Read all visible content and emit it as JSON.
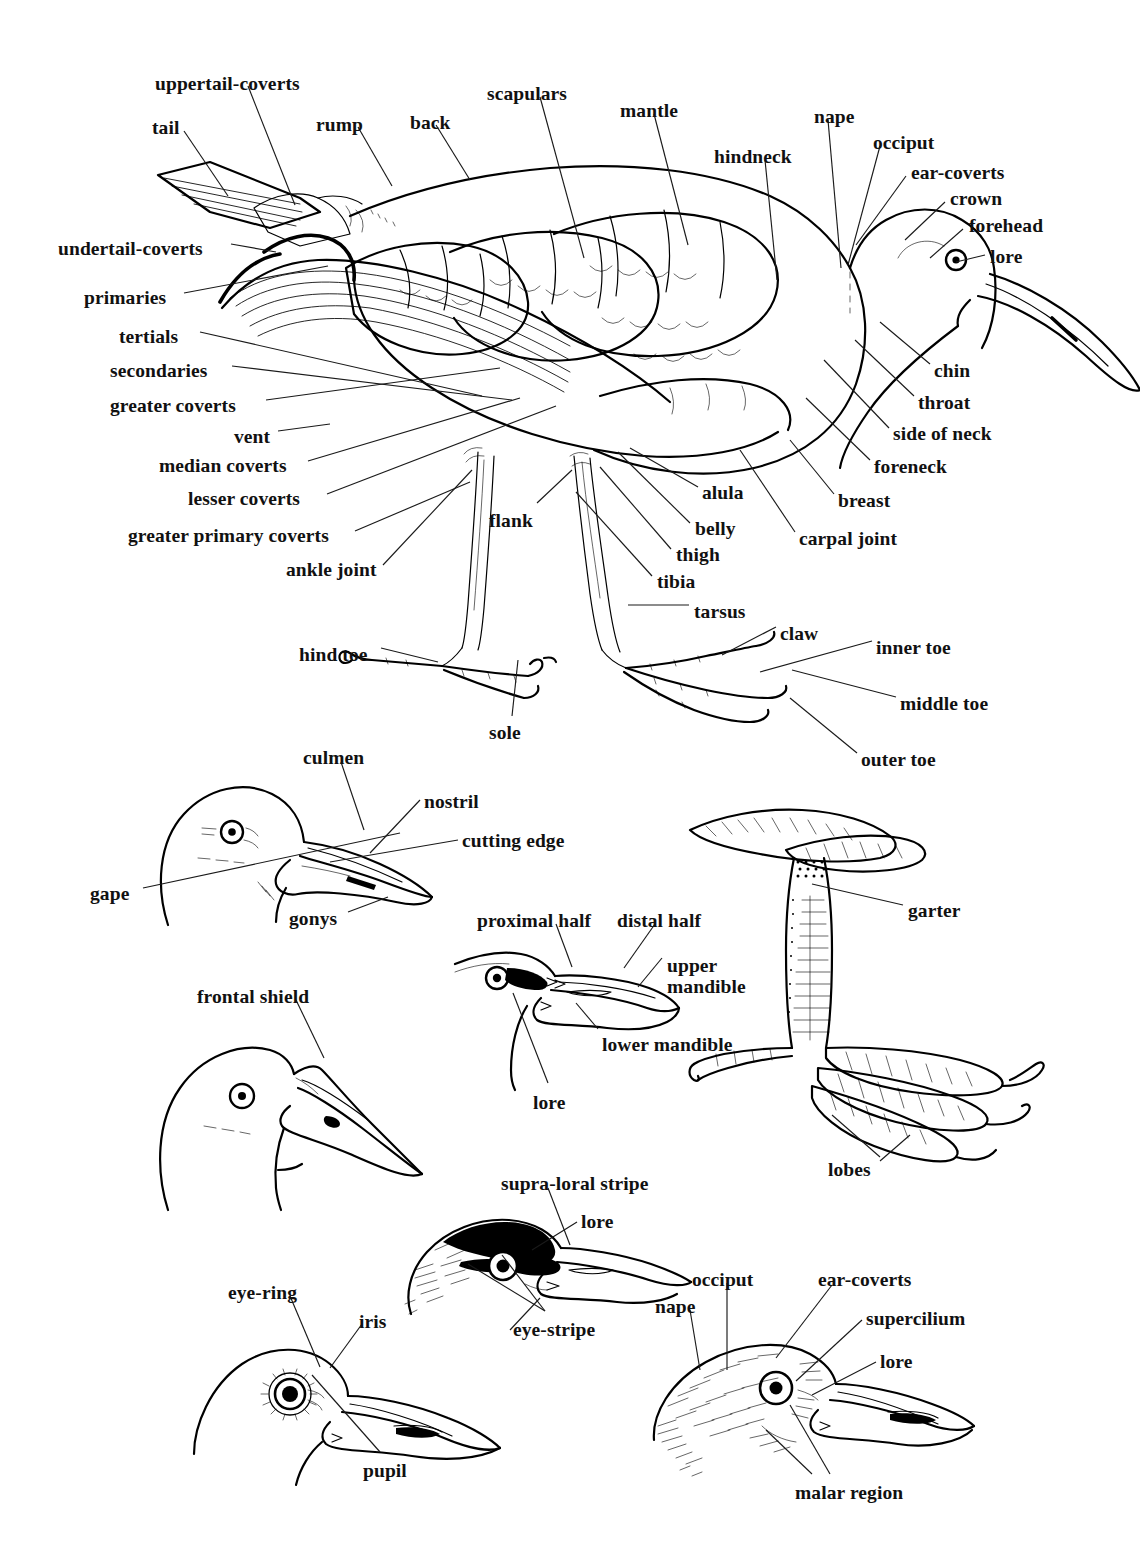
{
  "figure": {
    "ink_color": "#000000",
    "background_color": "#ffffff"
  },
  "panels": [
    {
      "id": "main-bird",
      "name": "whole-bird-topography"
    },
    {
      "id": "gull-head",
      "name": "bill-parts-head"
    },
    {
      "id": "mandible-head",
      "name": "mandible-halves-head"
    },
    {
      "id": "lobed-foot",
      "name": "lobed-foot-and-tarsus"
    },
    {
      "id": "shield-head",
      "name": "frontal-shield-head"
    },
    {
      "id": "striped-head",
      "name": "head-stripes"
    },
    {
      "id": "eye-head",
      "name": "eye-parts-head"
    },
    {
      "id": "pattern-head",
      "name": "head-feather-tracts"
    }
  ],
  "labels": {
    "main": [
      {
        "id": "uppertail-coverts",
        "text": "uppertail-coverts",
        "x": 155,
        "y": 74,
        "anchor": "left"
      },
      {
        "id": "tail",
        "text": "tail",
        "x": 152,
        "y": 118,
        "anchor": "left"
      },
      {
        "id": "rump",
        "text": "rump",
        "x": 316,
        "y": 115,
        "anchor": "left"
      },
      {
        "id": "back",
        "text": "back",
        "x": 410,
        "y": 113,
        "anchor": "left"
      },
      {
        "id": "scapulars",
        "text": "scapulars",
        "x": 487,
        "y": 84,
        "anchor": "left"
      },
      {
        "id": "mantle",
        "text": "mantle",
        "x": 620,
        "y": 101,
        "anchor": "left"
      },
      {
        "id": "hindneck",
        "text": "hindneck",
        "x": 714,
        "y": 147,
        "anchor": "left"
      },
      {
        "id": "nape",
        "text": "nape",
        "x": 814,
        "y": 107,
        "anchor": "left"
      },
      {
        "id": "occiput",
        "text": "occiput",
        "x": 873,
        "y": 133,
        "anchor": "left"
      },
      {
        "id": "ear-coverts",
        "text": "ear-coverts",
        "x": 911,
        "y": 163,
        "anchor": "left"
      },
      {
        "id": "crown",
        "text": "crown",
        "x": 950,
        "y": 189,
        "anchor": "left"
      },
      {
        "id": "forehead",
        "text": "forehead",
        "x": 969,
        "y": 216,
        "anchor": "left"
      },
      {
        "id": "lore",
        "text": "lore",
        "x": 990,
        "y": 247,
        "anchor": "left"
      },
      {
        "id": "undertail-coverts",
        "text": "undertail-coverts",
        "x": 58,
        "y": 239,
        "anchor": "left"
      },
      {
        "id": "primaries",
        "text": "primaries",
        "x": 84,
        "y": 288,
        "anchor": "left"
      },
      {
        "id": "tertials",
        "text": "tertials",
        "x": 119,
        "y": 327,
        "anchor": "left"
      },
      {
        "id": "secondaries",
        "text": "secondaries",
        "x": 110,
        "y": 361,
        "anchor": "left"
      },
      {
        "id": "greater-coverts",
        "text": "greater coverts",
        "x": 110,
        "y": 396,
        "anchor": "left"
      },
      {
        "id": "vent",
        "text": "vent",
        "x": 234,
        "y": 427,
        "anchor": "left"
      },
      {
        "id": "median-coverts",
        "text": "median coverts",
        "x": 159,
        "y": 456,
        "anchor": "left"
      },
      {
        "id": "lesser-coverts",
        "text": "lesser coverts",
        "x": 188,
        "y": 489,
        "anchor": "left"
      },
      {
        "id": "greater-primary-coverts",
        "text": "greater primary coverts",
        "x": 128,
        "y": 526,
        "anchor": "left"
      },
      {
        "id": "ankle-joint",
        "text": "ankle joint",
        "x": 286,
        "y": 560,
        "anchor": "left"
      },
      {
        "id": "flank",
        "text": "flank",
        "x": 489,
        "y": 511,
        "anchor": "left"
      },
      {
        "id": "alula",
        "text": "alula",
        "x": 702,
        "y": 483,
        "anchor": "left"
      },
      {
        "id": "belly",
        "text": "belly",
        "x": 695,
        "y": 519,
        "anchor": "left"
      },
      {
        "id": "thigh",
        "text": "thigh",
        "x": 676,
        "y": 545,
        "anchor": "left"
      },
      {
        "id": "tibia",
        "text": "tibia",
        "x": 657,
        "y": 572,
        "anchor": "left"
      },
      {
        "id": "tarsus",
        "text": "tarsus",
        "x": 694,
        "y": 602,
        "anchor": "left"
      },
      {
        "id": "carpal-joint",
        "text": "carpal joint",
        "x": 799,
        "y": 529,
        "anchor": "left"
      },
      {
        "id": "breast",
        "text": "breast",
        "x": 838,
        "y": 491,
        "anchor": "left"
      },
      {
        "id": "foreneck",
        "text": "foreneck",
        "x": 874,
        "y": 457,
        "anchor": "left"
      },
      {
        "id": "side-of-neck",
        "text": "side of neck",
        "x": 893,
        "y": 424,
        "anchor": "left"
      },
      {
        "id": "throat",
        "text": "throat",
        "x": 918,
        "y": 393,
        "anchor": "left"
      },
      {
        "id": "chin",
        "text": "chin",
        "x": 934,
        "y": 361,
        "anchor": "left"
      },
      {
        "id": "claw",
        "text": "claw",
        "x": 780,
        "y": 624,
        "anchor": "left"
      },
      {
        "id": "inner-toe",
        "text": "inner toe",
        "x": 876,
        "y": 638,
        "anchor": "left"
      },
      {
        "id": "middle-toe",
        "text": "middle toe",
        "x": 900,
        "y": 694,
        "anchor": "left"
      },
      {
        "id": "outer-toe",
        "text": "outer toe",
        "x": 861,
        "y": 750,
        "anchor": "left"
      },
      {
        "id": "hind-toe",
        "text": "hind toe",
        "x": 299,
        "y": 645,
        "anchor": "left"
      },
      {
        "id": "sole",
        "text": "sole",
        "x": 489,
        "y": 723,
        "anchor": "left"
      }
    ],
    "gull_head": [
      {
        "id": "culmen",
        "text": "culmen",
        "x": 303,
        "y": 748,
        "anchor": "left"
      },
      {
        "id": "nostril",
        "text": "nostril",
        "x": 424,
        "y": 792,
        "anchor": "left"
      },
      {
        "id": "cutting-edge",
        "text": "cutting edge",
        "x": 462,
        "y": 831,
        "anchor": "left"
      },
      {
        "id": "gape",
        "text": "gape",
        "x": 90,
        "y": 884,
        "anchor": "left"
      },
      {
        "id": "gonys",
        "text": "gonys",
        "x": 289,
        "y": 909,
        "anchor": "left"
      }
    ],
    "mandible_head": [
      {
        "id": "proximal-half",
        "text": "proximal half",
        "x": 477,
        "y": 911,
        "anchor": "left"
      },
      {
        "id": "distal-half",
        "text": "distal half",
        "x": 617,
        "y": 911,
        "anchor": "left"
      },
      {
        "id": "upper-mandible",
        "text": "upper\nmandible",
        "x": 667,
        "y": 955,
        "anchor": "left"
      },
      {
        "id": "lower-mandible",
        "text": "lower mandible",
        "x": 602,
        "y": 1035,
        "anchor": "left"
      },
      {
        "id": "lore",
        "text": "lore",
        "x": 533,
        "y": 1093,
        "anchor": "left"
      }
    ],
    "lobed_foot": [
      {
        "id": "garter",
        "text": "garter",
        "x": 908,
        "y": 901,
        "anchor": "left"
      },
      {
        "id": "lobes",
        "text": "lobes",
        "x": 828,
        "y": 1160,
        "anchor": "left"
      }
    ],
    "shield_head": [
      {
        "id": "frontal-shield",
        "text": "frontal shield",
        "x": 197,
        "y": 987,
        "anchor": "left"
      }
    ],
    "striped_head": [
      {
        "id": "supra-loral-stripe",
        "text": "supra-loral stripe",
        "x": 501,
        "y": 1174,
        "anchor": "left"
      },
      {
        "id": "lore",
        "text": "lore",
        "x": 581,
        "y": 1212,
        "anchor": "left"
      },
      {
        "id": "eye-stripe",
        "text": "eye-stripe",
        "x": 513,
        "y": 1320,
        "anchor": "left"
      }
    ],
    "eye_head": [
      {
        "id": "eye-ring",
        "text": "eye-ring",
        "x": 228,
        "y": 1283,
        "anchor": "left"
      },
      {
        "id": "iris",
        "text": "iris",
        "x": 359,
        "y": 1312,
        "anchor": "left"
      },
      {
        "id": "pupil",
        "text": "pupil",
        "x": 363,
        "y": 1461,
        "anchor": "left"
      }
    ],
    "pattern_head": [
      {
        "id": "occiput",
        "text": "occiput",
        "x": 692,
        "y": 1270,
        "anchor": "left"
      },
      {
        "id": "ear-coverts",
        "text": "ear-coverts",
        "x": 818,
        "y": 1270,
        "anchor": "left"
      },
      {
        "id": "nape",
        "text": "nape",
        "x": 655,
        "y": 1297,
        "anchor": "left"
      },
      {
        "id": "supercilium",
        "text": "supercilium",
        "x": 866,
        "y": 1309,
        "anchor": "left"
      },
      {
        "id": "lore",
        "text": "lore",
        "x": 880,
        "y": 1352,
        "anchor": "left"
      },
      {
        "id": "malar-region",
        "text": "malar region",
        "x": 795,
        "y": 1483,
        "anchor": "left"
      }
    ]
  }
}
